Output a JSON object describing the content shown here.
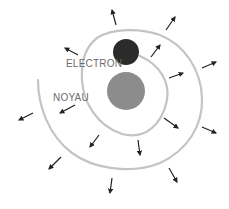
{
  "diagram": {
    "labels": {
      "electron": "ELECTRON",
      "nucleus": "NOYAU"
    },
    "colors": {
      "background": "#ffffff",
      "spiral": "#c4c4c4",
      "electron": "#2b2b2b",
      "nucleus": "#8c8c8c",
      "arrow": "#222222",
      "label": "#6b6b6b"
    },
    "electron": {
      "cx": 126,
      "cy": 52,
      "r": 13
    },
    "nucleus": {
      "cx": 126,
      "cy": 91,
      "r": 19
    },
    "spiral_path": "M38,80 C38,105 48,135 72,153 C92,168 130,175 160,163 C188,150 203,125 202,98 C201,70 185,45 160,35 C140,28 112,28 97,38 C85,47 81,62 82,80 C83,100 95,125 122,134 C145,140 162,125 167,100 C170,82 160,65 140,56",
    "arrows": [
      {
        "x1": 116,
        "y1": 25,
        "x2": 112,
        "y2": 10
      },
      {
        "x1": 166,
        "y1": 30,
        "x2": 175,
        "y2": 17
      },
      {
        "x1": 78,
        "y1": 55,
        "x2": 65,
        "y2": 48
      },
      {
        "x1": 151,
        "y1": 57,
        "x2": 160,
        "y2": 45
      },
      {
        "x1": 169,
        "y1": 78,
        "x2": 183,
        "y2": 73
      },
      {
        "x1": 202,
        "y1": 68,
        "x2": 216,
        "y2": 62
      },
      {
        "x1": 33,
        "y1": 113,
        "x2": 19,
        "y2": 120
      },
      {
        "x1": 75,
        "y1": 105,
        "x2": 60,
        "y2": 113
      },
      {
        "x1": 99,
        "y1": 135,
        "x2": 90,
        "y2": 147
      },
      {
        "x1": 138,
        "y1": 140,
        "x2": 140,
        "y2": 155
      },
      {
        "x1": 164,
        "y1": 118,
        "x2": 178,
        "y2": 128
      },
      {
        "x1": 202,
        "y1": 127,
        "x2": 216,
        "y2": 133
      },
      {
        "x1": 61,
        "y1": 157,
        "x2": 49,
        "y2": 169
      },
      {
        "x1": 112,
        "y1": 178,
        "x2": 110,
        "y2": 193
      },
      {
        "x1": 169,
        "y1": 168,
        "x2": 177,
        "y2": 182
      }
    ]
  }
}
